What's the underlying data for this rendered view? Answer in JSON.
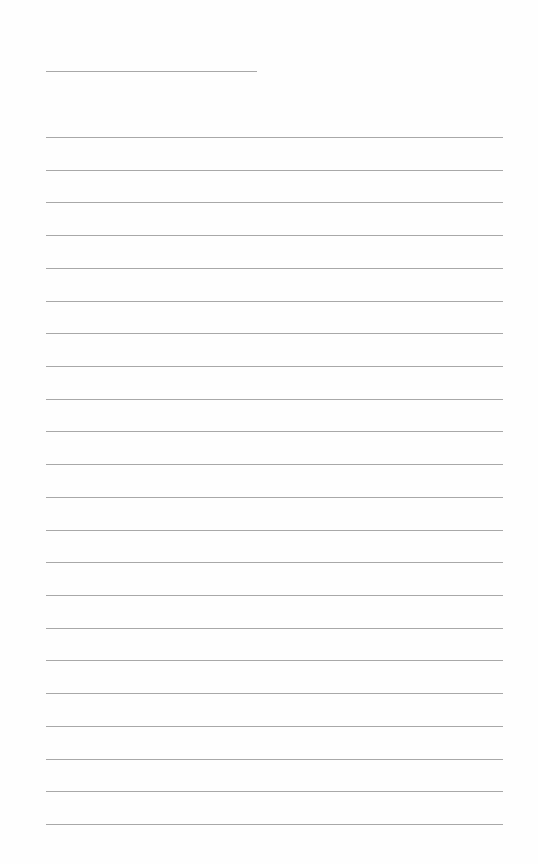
{
  "document": {
    "type": "lined-paper",
    "title_line": {
      "text": ""
    },
    "lines": [
      {
        "text": ""
      },
      {
        "text": ""
      },
      {
        "text": ""
      },
      {
        "text": ""
      },
      {
        "text": ""
      },
      {
        "text": ""
      },
      {
        "text": ""
      },
      {
        "text": ""
      },
      {
        "text": ""
      },
      {
        "text": ""
      },
      {
        "text": ""
      },
      {
        "text": ""
      },
      {
        "text": ""
      },
      {
        "text": ""
      },
      {
        "text": ""
      },
      {
        "text": ""
      },
      {
        "text": ""
      },
      {
        "text": ""
      },
      {
        "text": ""
      },
      {
        "text": ""
      },
      {
        "text": ""
      },
      {
        "text": ""
      }
    ],
    "line_color": "#a8a8a8",
    "background_color": "#ffffff"
  }
}
